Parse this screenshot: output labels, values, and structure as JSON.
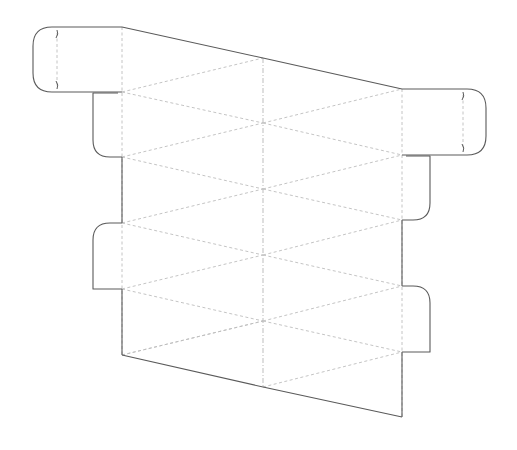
{
  "diagram": {
    "type": "papercraft-die-cut-template",
    "width": 517,
    "height": 450,
    "colors": {
      "background": "#ffffff",
      "cut_line": "#5a5a5a",
      "fold_line": "#bdbdbd",
      "center_fold_line": "#b5b5b5"
    },
    "columns": {
      "left_x": 122,
      "middle_x": 263,
      "right_x": 402
    },
    "nodes": {
      "left_y": [
        27,
        92,
        157,
        223,
        289,
        355
      ],
      "middle_y": [
        58,
        123,
        189,
        255,
        321,
        387
      ],
      "right_y": [
        89,
        155,
        220,
        286,
        352,
        417
      ]
    },
    "tabs": [
      {
        "name": "top-left-locking-tab",
        "side": "left",
        "x1": 33,
        "x2": 122,
        "y1": 27,
        "y2": 92,
        "slit_x": 57
      },
      {
        "name": "left-glue-tab-1",
        "side": "left",
        "x1": 93,
        "x2": 122,
        "y1": 93,
        "y2": 157,
        "rounded": "bottom-left"
      },
      {
        "name": "left-glue-tab-2",
        "side": "left",
        "x1": 93,
        "x2": 122,
        "y1": 223,
        "y2": 289,
        "rounded": "top-left"
      },
      {
        "name": "top-right-locking-tab",
        "side": "right",
        "x1": 402,
        "x2": 486,
        "y1": 89,
        "y2": 155,
        "slit_x": 463
      },
      {
        "name": "right-glue-tab-1",
        "side": "right",
        "x1": 402,
        "x2": 430,
        "y1": 155,
        "y2": 220,
        "rounded": "bottom-right"
      },
      {
        "name": "right-glue-tab-2",
        "side": "right",
        "x1": 402,
        "x2": 430,
        "y1": 286,
        "y2": 352,
        "rounded": "top-right"
      }
    ]
  }
}
